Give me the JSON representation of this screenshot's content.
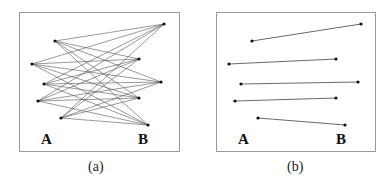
{
  "panels": [
    {
      "id": "a",
      "caption": "(a)",
      "type": "complete-bipartite",
      "label_left": "A",
      "label_right": "B",
      "edge_count": 25
    },
    {
      "id": "b",
      "caption": "(b)",
      "type": "matching",
      "label_left": "A",
      "label_right": "B",
      "matching": [
        [
          0,
          0
        ],
        [
          1,
          1
        ],
        [
          2,
          2
        ],
        [
          3,
          3
        ],
        [
          4,
          4
        ]
      ]
    }
  ],
  "set_A_size": 5,
  "set_B_size": 5
}
